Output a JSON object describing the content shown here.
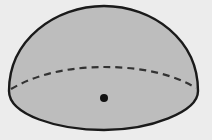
{
  "diagram": {
    "type": "hemisphere",
    "colors": {
      "background": "#ececec",
      "fill": "#bdbdbd",
      "stroke": "#1a1a1a",
      "dashed": "#333333",
      "center_point": "#111111"
    },
    "elements": [
      {
        "name": "dome-outline",
        "kind": "solid-curve"
      },
      {
        "name": "base-front-rim",
        "kind": "solid-curve"
      },
      {
        "name": "base-back-rim",
        "kind": "dashed-curve"
      },
      {
        "name": "center-point",
        "kind": "dot"
      }
    ]
  }
}
